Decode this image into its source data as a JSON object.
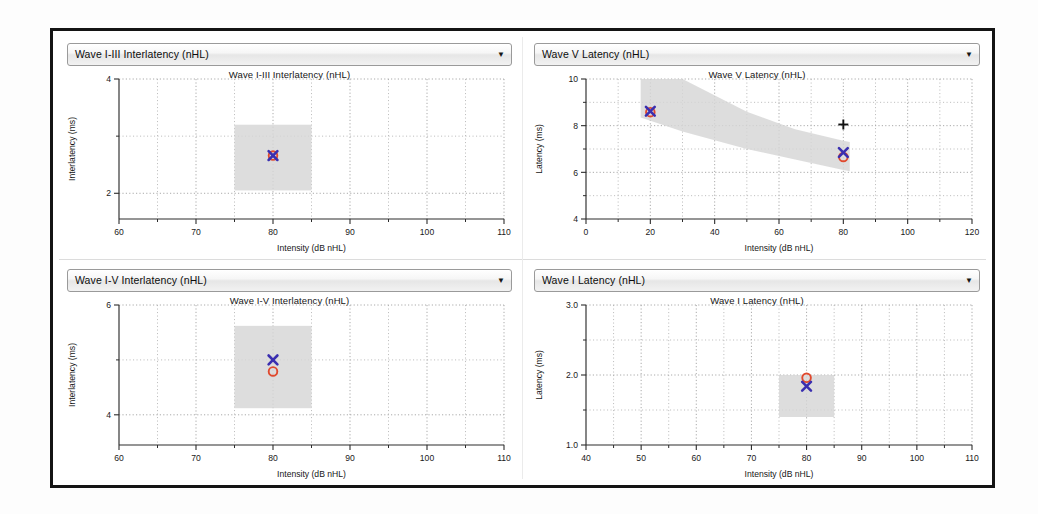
{
  "window": {
    "title": "ABR Latency-Intensity Panels"
  },
  "axis_common": {
    "xlabel": "Intensity (dB nHL)",
    "ylabel_latency": "Latency (ms)",
    "ylabel_interlatency": "Interlatency (ms)",
    "dropdown_arrow_glyph": "▼"
  },
  "colors": {
    "marker_circle": "#e0492e",
    "marker_x": "#3a2fb0",
    "marker_plus": "#111111",
    "normative_band": "#d6d6d6",
    "frame": "#141414",
    "grid": "#b4b4b4",
    "axis": "#2c2c2c",
    "panel_background": "#ffffff"
  },
  "panels": [
    {
      "id": "top-left",
      "dropdown": {
        "selected": "Wave I-III Interlatency (nHL)",
        "options": [
          "Wave I Latency (nHL)",
          "Wave III Latency (nHL)",
          "Wave V Latency (nHL)",
          "Wave I-III Interlatency (nHL)",
          "Wave III-V Interlatency (nHL)",
          "Wave I-V Interlatency (nHL)"
        ]
      },
      "chart_data": {
        "type": "scatter",
        "title": "Wave I-III Interlatency (nHL)",
        "xlabel": "Intensity (dB nHL)",
        "ylabel": "Interlatency (ms)",
        "xlim": [
          60,
          110
        ],
        "ylim": [
          1.55,
          4
        ],
        "xticks_major": [
          60,
          70,
          80,
          90,
          100,
          110
        ],
        "xticks_minor": [
          65,
          75,
          85,
          95,
          105
        ],
        "yticks_major": [
          2,
          4
        ],
        "yticks_minor": [
          3
        ],
        "ytick_labels": [
          "2",
          "4"
        ],
        "grid": true,
        "normative_band": {
          "x_range": [
            75,
            85
          ],
          "y_range": [
            2.05,
            3.2
          ]
        },
        "series": [
          {
            "name": "Right ear (circle)",
            "marker": "circle",
            "color": "#e0492e",
            "points": [
              {
                "x": 80,
                "y": 2.66
              }
            ]
          },
          {
            "name": "Left ear (X)",
            "marker": "x",
            "color": "#3a2fb0",
            "points": [
              {
                "x": 80,
                "y": 2.66
              }
            ]
          }
        ]
      }
    },
    {
      "id": "top-right",
      "dropdown": {
        "selected": "Wave V Latency (nHL)",
        "options": [
          "Wave I Latency (nHL)",
          "Wave III Latency (nHL)",
          "Wave V Latency (nHL)",
          "Wave I-III Interlatency (nHL)",
          "Wave III-V Interlatency (nHL)",
          "Wave I-V Interlatency (nHL)"
        ]
      },
      "chart_data": {
        "type": "scatter",
        "title": "Wave V Latency (nHL)",
        "xlabel": "Intensity (dB nHL)",
        "ylabel": "Latency (ms)",
        "xlim": [
          0,
          120
        ],
        "ylim": [
          4,
          10
        ],
        "xticks_major": [
          0,
          20,
          40,
          60,
          80,
          100,
          120
        ],
        "xticks_minor": [
          10,
          30,
          50,
          70,
          90,
          110
        ],
        "yticks_major": [
          4,
          6,
          8,
          10
        ],
        "yticks_minor": [
          5,
          7,
          9
        ],
        "ytick_labels": [
          "4",
          "6",
          "8",
          "10"
        ],
        "grid": true,
        "normative_band": {
          "upper": [
            {
              "x": 17,
              "y": 10.0
            },
            {
              "x": 30,
              "y": 10.0
            },
            {
              "x": 50,
              "y": 8.6
            },
            {
              "x": 65,
              "y": 7.85
            },
            {
              "x": 80,
              "y": 7.35
            },
            {
              "x": 82,
              "y": 7.3
            }
          ],
          "lower": [
            {
              "x": 17,
              "y": 8.35
            },
            {
              "x": 30,
              "y": 7.75
            },
            {
              "x": 50,
              "y": 7.0
            },
            {
              "x": 65,
              "y": 6.55
            },
            {
              "x": 80,
              "y": 6.1
            },
            {
              "x": 82,
              "y": 6.05
            }
          ]
        },
        "series": [
          {
            "name": "Right ear (circle)",
            "marker": "circle",
            "color": "#e0492e",
            "points": [
              {
                "x": 20,
                "y": 8.58
              },
              {
                "x": 80,
                "y": 6.66
              }
            ]
          },
          {
            "name": "Left ear (X)",
            "marker": "x",
            "color": "#3a2fb0",
            "points": [
              {
                "x": 20,
                "y": 8.62
              },
              {
                "x": 80,
                "y": 6.85
              }
            ]
          },
          {
            "name": "No response (plus)",
            "marker": "plus",
            "color": "#111111",
            "points": [
              {
                "x": 80,
                "y": 8.05
              }
            ]
          }
        ]
      }
    },
    {
      "id": "bottom-left",
      "dropdown": {
        "selected": "Wave I-V Interlatency (nHL)",
        "options": [
          "Wave I Latency (nHL)",
          "Wave III Latency (nHL)",
          "Wave V Latency (nHL)",
          "Wave I-III Interlatency (nHL)",
          "Wave III-V Interlatency (nHL)",
          "Wave I-V Interlatency (nHL)"
        ]
      },
      "chart_data": {
        "type": "scatter",
        "title": "Wave I-V Interlatency (nHL)",
        "xlabel": "Intensity (dB nHL)",
        "ylabel": "Interlatency (ms)",
        "xlim": [
          60,
          110
        ],
        "ylim": [
          3.45,
          6
        ],
        "xticks_major": [
          60,
          70,
          80,
          90,
          100,
          110
        ],
        "xticks_minor": [
          65,
          75,
          85,
          95,
          105
        ],
        "yticks_major": [
          4,
          6
        ],
        "yticks_minor": [
          5
        ],
        "ytick_labels": [
          "4",
          "6"
        ],
        "grid": true,
        "normative_band": {
          "x_range": [
            75,
            85
          ],
          "y_range": [
            4.12,
            5.62
          ]
        },
        "series": [
          {
            "name": "Right ear (circle)",
            "marker": "circle",
            "color": "#e0492e",
            "points": [
              {
                "x": 80,
                "y": 4.79
              }
            ]
          },
          {
            "name": "Left ear (X)",
            "marker": "x",
            "color": "#3a2fb0",
            "points": [
              {
                "x": 80,
                "y": 5.0
              }
            ]
          }
        ]
      }
    },
    {
      "id": "bottom-right",
      "dropdown": {
        "selected": "Wave I Latency (nHL)",
        "options": [
          "Wave I Latency (nHL)",
          "Wave III Latency (nHL)",
          "Wave V Latency (nHL)",
          "Wave I-III Interlatency (nHL)",
          "Wave III-V Interlatency (nHL)",
          "Wave I-V Interlatency (nHL)"
        ]
      },
      "chart_data": {
        "type": "scatter",
        "title": "Wave I Latency (nHL)",
        "xlabel": "Intensity (dB nHL)",
        "ylabel": "Latency (ms)",
        "xlim": [
          40,
          110
        ],
        "ylim": [
          1.0,
          3.0
        ],
        "xticks_major": [
          40,
          50,
          60,
          70,
          80,
          90,
          100,
          110
        ],
        "xticks_minor": [
          45,
          55,
          65,
          75,
          85,
          95,
          105
        ],
        "yticks_major": [
          1.0,
          2.0,
          3.0
        ],
        "yticks_minor": [
          1.5,
          2.5
        ],
        "ytick_labels": [
          "1.0",
          "2.0",
          "3.0"
        ],
        "grid": true,
        "normative_band": {
          "x_range": [
            75,
            85
          ],
          "y_range": [
            1.4,
            2.0
          ]
        },
        "series": [
          {
            "name": "Right ear (circle)",
            "marker": "circle",
            "color": "#e0492e",
            "points": [
              {
                "x": 80,
                "y": 1.96
              }
            ]
          },
          {
            "name": "Left ear (X)",
            "marker": "x",
            "color": "#3a2fb0",
            "points": [
              {
                "x": 80,
                "y": 1.84
              }
            ]
          }
        ]
      }
    }
  ]
}
